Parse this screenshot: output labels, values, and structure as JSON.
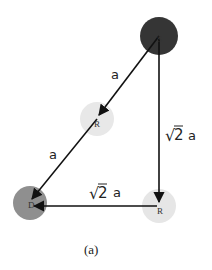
{
  "diagram": {
    "nodes": [
      {
        "id": "S",
        "label": "S",
        "cx": 159,
        "cy": 36,
        "r": 19,
        "fill": "#353535"
      },
      {
        "id": "R1",
        "label": "R",
        "cx": 97,
        "cy": 119,
        "r": 17,
        "fill": "#e8e8e8"
      },
      {
        "id": "D",
        "label": "D",
        "cx": 30,
        "cy": 203,
        "r": 17,
        "fill": "#8f8f8f"
      },
      {
        "id": "R2",
        "label": "R",
        "cx": 159,
        "cy": 206,
        "r": 17,
        "fill": "#e6e6e6"
      }
    ],
    "edges": [
      {
        "from": "S",
        "to": "R1",
        "label": "a"
      },
      {
        "from": "R1",
        "to": "D",
        "label": "a"
      },
      {
        "from": "S",
        "to": "R2",
        "label": "√2 a"
      },
      {
        "from": "R2",
        "to": "D",
        "label": "√2 a"
      }
    ],
    "labels": {
      "edge_s_r1": "a",
      "edge_r1_d": "a",
      "edge_s_r2_radical": "√",
      "edge_s_r2_value": "2",
      "edge_s_r2_suffix": "a",
      "edge_r2_d_radical": "√",
      "edge_r2_d_value": "2",
      "edge_r2_d_suffix": "a",
      "node_s": "S",
      "node_r1": "R",
      "node_d": "D",
      "node_r2": "R"
    },
    "caption": "(a)",
    "colors": {
      "source": "#353535",
      "relay": "#e8e8e8",
      "destination": "#8f8f8f",
      "line": "#111111"
    }
  }
}
